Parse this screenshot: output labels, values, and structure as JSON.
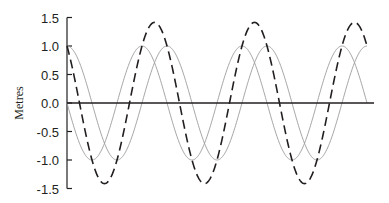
{
  "chart_data": {
    "type": "line",
    "title": "",
    "xlabel": "",
    "ylabel": "Metres",
    "ylim": [
      -1.5,
      1.5
    ],
    "yticks": [
      1.5,
      1.0,
      0.5,
      0.0,
      -0.5,
      -1.0,
      -1.5
    ],
    "ytick_labels": [
      "1.5",
      "1.0",
      "0.5",
      "0.0",
      "-0.5",
      "-1.0",
      "-1.5"
    ],
    "x_range_periods": [
      0,
      3
    ],
    "grid": false,
    "legend": null,
    "series": [
      {
        "name": "wave-a",
        "style": "solid-light",
        "color": "#9a9a9a",
        "amplitude": 1.0,
        "phase_deg": 0,
        "function": "cos",
        "samples_per_period": [
          1.0,
          0.0,
          -1.0,
          0.0,
          1.0
        ]
      },
      {
        "name": "wave-b",
        "style": "solid-light",
        "color": "#9a9a9a",
        "amplitude": 1.0,
        "phase_deg": 90,
        "function": "-sin",
        "samples_per_period": [
          0.0,
          -1.0,
          0.0,
          1.0,
          0.0
        ]
      },
      {
        "name": "sum",
        "style": "dashed-dark",
        "color": "#231f20",
        "amplitude": 1.41,
        "phase_deg": 45,
        "function": "cos - sin",
        "samples_per_period": [
          1.0,
          -1.0,
          -1.0,
          1.0,
          1.0
        ]
      }
    ],
    "zero_line": true
  }
}
